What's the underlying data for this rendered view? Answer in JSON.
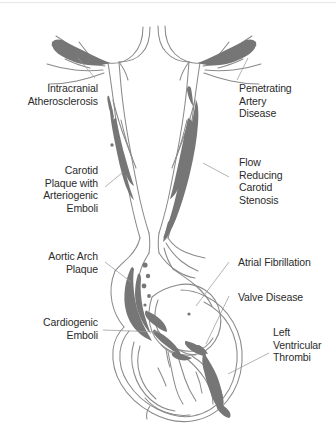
{
  "figure": {
    "caption": "",
    "background_color": "#ffffff",
    "outline_color": "#8a8a8a",
    "plaque_color": "#767676",
    "leader_line_color": "#9a9a9a",
    "text_color": "#2b2b2b"
  },
  "labels": {
    "intracranial_atherosclerosis": {
      "lines": [
        "Intracranial",
        "Atherosclerosis"
      ],
      "text": "Intracranial\nAtherosclerosis",
      "align": "right",
      "side": "left",
      "points_to": "cerebral-artery-branch-left"
    },
    "carotid_plaque": {
      "lines": [
        "Carotid",
        "Plaque with",
        "Arteriogenic",
        "Emboli"
      ],
      "text": "Carotid\nPlaque with\nArteriogenic\nEmboli",
      "align": "right",
      "side": "left",
      "points_to": "left-carotid-plaque"
    },
    "aortic_arch_plaque": {
      "lines": [
        "Aortic Arch",
        "Plaque"
      ],
      "text": "Aortic Arch\nPlaque",
      "align": "right",
      "side": "left",
      "points_to": "aortic-arch-plaque"
    },
    "cardiogenic_emboli": {
      "lines": [
        "Cardiogenic",
        "Emboli"
      ],
      "text": "Cardiogenic\nEmboli",
      "align": "right",
      "side": "left",
      "points_to": "cardiac-chamber-emboli"
    },
    "penetrating_artery_disease": {
      "lines": [
        "Penetrating",
        "Artery",
        "Disease"
      ],
      "text": "Penetrating\nArtery\nDisease",
      "align": "left",
      "side": "right",
      "points_to": "cerebral-artery-branch-right"
    },
    "flow_reducing_carotid_stenosis": {
      "lines": [
        "Flow",
        "Reducing",
        "Carotid",
        "Stenosis"
      ],
      "text": "Flow\nReducing\nCarotid\nStenosis",
      "align": "left",
      "side": "right",
      "points_to": "right-carotid-stenosis"
    },
    "atrial_fibrillation": {
      "lines": [
        "Atrial Fibrillation"
      ],
      "text": "Atrial Fibrillation",
      "align": "left",
      "side": "right",
      "points_to": "left-atrium"
    },
    "valve_disease": {
      "lines": [
        "Valve Disease"
      ],
      "text": "Valve Disease",
      "align": "left",
      "side": "right",
      "points_to": "mitral-valve"
    },
    "left_ventricular_thrombi": {
      "lines": [
        "Left",
        "Ventricular",
        "Thrombi"
      ],
      "text": "Left\nVentricular\nThrombi",
      "align": "left",
      "side": "right",
      "points_to": "left-ventricle-thrombus"
    }
  }
}
